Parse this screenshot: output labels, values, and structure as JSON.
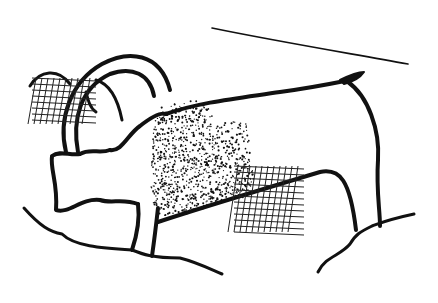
{
  "illustration": {
    "subject": "cave-art animal line drawing",
    "ink_color": "#111111",
    "background_color": "#ffffff",
    "elements": [
      "horns",
      "head",
      "body-outline",
      "back-line",
      "tail",
      "front-leg",
      "hind-leg",
      "ground-line",
      "rock-ledge-line",
      "stippled-shading",
      "cross-hatch-left",
      "cross-hatch-right"
    ]
  }
}
